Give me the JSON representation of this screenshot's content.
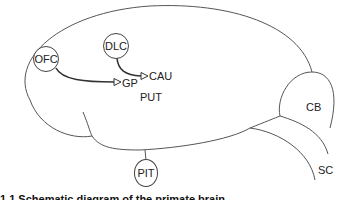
{
  "diagram": {
    "type": "brain-schematic",
    "nodes": [
      {
        "id": "ofc",
        "label": "OFC",
        "shape": "circle"
      },
      {
        "id": "dlc",
        "label": "DLC",
        "shape": "circle"
      },
      {
        "id": "pit",
        "label": "PIT",
        "shape": "ellipse"
      }
    ],
    "labels": {
      "gp": "GP",
      "cau": "CAU",
      "put": "PUT",
      "cb": "CB",
      "sc": "SC"
    },
    "edges": [
      {
        "from": "OFC",
        "to": "GP",
        "style": "curved-arrow"
      },
      {
        "from": "DLC",
        "to": "CAU",
        "style": "curved-arrow"
      }
    ],
    "stroke_color": "#444444",
    "caption": "1.1 Schematic diagram of the primate brain"
  }
}
